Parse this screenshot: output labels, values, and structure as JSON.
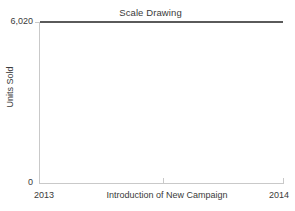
{
  "chart_data": {
    "type": "line",
    "title": "Scale Drawing",
    "xlabel": "Introduction of New Campaign",
    "ylabel": "Units Sold",
    "x": [
      "2013",
      "2014"
    ],
    "xtick_labels": [
      "2013",
      "2014"
    ],
    "ytick_labels": [
      "6,020",
      "0"
    ],
    "ylim": [
      0,
      6020
    ],
    "values": [
      6005,
      6020
    ],
    "series": [
      {
        "name": "Units Sold",
        "values": [
          6005,
          6020
        ],
        "color": "#5a5a5a"
      }
    ],
    "annotations": [
      {
        "text": "Growth rate since 2013 = 0.0025",
        "position": "top-center"
      }
    ],
    "grid": false,
    "legend": "none",
    "axis_color": "#c9c9c9",
    "text_color": "#3a3a3a",
    "background": "#ffffff"
  },
  "labels": {
    "y_top": "6,020",
    "y_bottom": "0",
    "x_left": "2013",
    "x_right": "2014"
  }
}
